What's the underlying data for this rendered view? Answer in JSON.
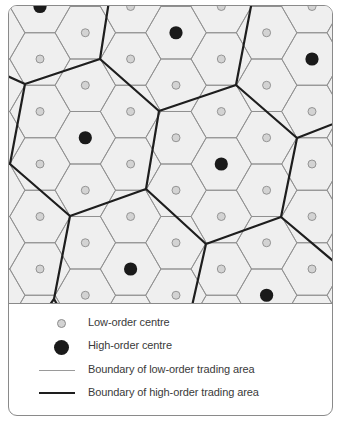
{
  "diagram": {
    "type": "central-place-theory-hexagonal-market-areas",
    "colors": {
      "background": "#efefef",
      "low_order_boundary": "#8f8f8f",
      "high_order_boundary": "#1e1e1e",
      "low_order_centre_fill": "#d3d3d3",
      "high_order_centre_fill": "#1a1a1a",
      "frame_border": "#8a8a8a"
    },
    "hex_grid": {
      "orientation": "flat-top",
      "radius": 30.3,
      "column_x": [
        -6.3,
        39,
        84.3,
        129.6,
        175,
        220.3,
        265.6,
        311,
        356.3
      ],
      "even_column_y": [
        5.5,
        58,
        110.5,
        163,
        215.5,
        268,
        320.5
      ],
      "odd_column_y": [
        -20.75,
        31.75,
        84.25,
        136.75,
        189.25,
        241.75,
        294.25,
        346.75
      ]
    },
    "high_order_centres": [
      {
        "x": 39,
        "y": 5.5
      },
      {
        "x": 175,
        "y": 31.75
      },
      {
        "x": 311,
        "y": 58
      },
      {
        "x": 84.3,
        "y": 136.75
      },
      {
        "x": 220.3,
        "y": 163
      },
      {
        "x": 129.6,
        "y": 268
      },
      {
        "x": 265.6,
        "y": 294.25
      }
    ],
    "high_order_boundaries": [
      [
        [
          108,
          0
        ],
        [
          99,
          58
        ],
        [
          24,
          83
        ],
        [
          0,
          72
        ]
      ],
      [
        [
          99,
          58
        ],
        [
          158,
          110
        ],
        [
          235,
          84
        ],
        [
          251,
          0
        ]
      ],
      [
        [
          235,
          84
        ],
        [
          296,
          137
        ],
        [
          337,
          121
        ]
      ],
      [
        [
          296,
          137
        ],
        [
          280,
          216
        ],
        [
          337,
          264
        ]
      ],
      [
        [
          280,
          216
        ],
        [
          205,
          243
        ],
        [
          191,
          305
        ]
      ],
      [
        [
          205,
          243
        ],
        [
          145,
          188
        ],
        [
          158,
          110
        ]
      ],
      [
        [
          145,
          188
        ],
        [
          69,
          215
        ],
        [
          9,
          163
        ],
        [
          24,
          83
        ]
      ],
      [
        [
          9,
          163
        ],
        [
          0,
          160
        ]
      ],
      [
        [
          69,
          215
        ],
        [
          53,
          298
        ],
        [
          48,
          305
        ]
      ],
      [
        [
          53,
          298
        ],
        [
          57,
          305
        ]
      ]
    ]
  },
  "legend": {
    "items": [
      {
        "symbol": "low-order-centre-dot",
        "label": "Low-order centre"
      },
      {
        "symbol": "high-order-centre-dot",
        "label": "High-order centre"
      },
      {
        "symbol": "thin-line",
        "label": "Boundary of low-order trading area"
      },
      {
        "symbol": "thick-line",
        "label": "Boundary of high-order trading area"
      }
    ]
  }
}
